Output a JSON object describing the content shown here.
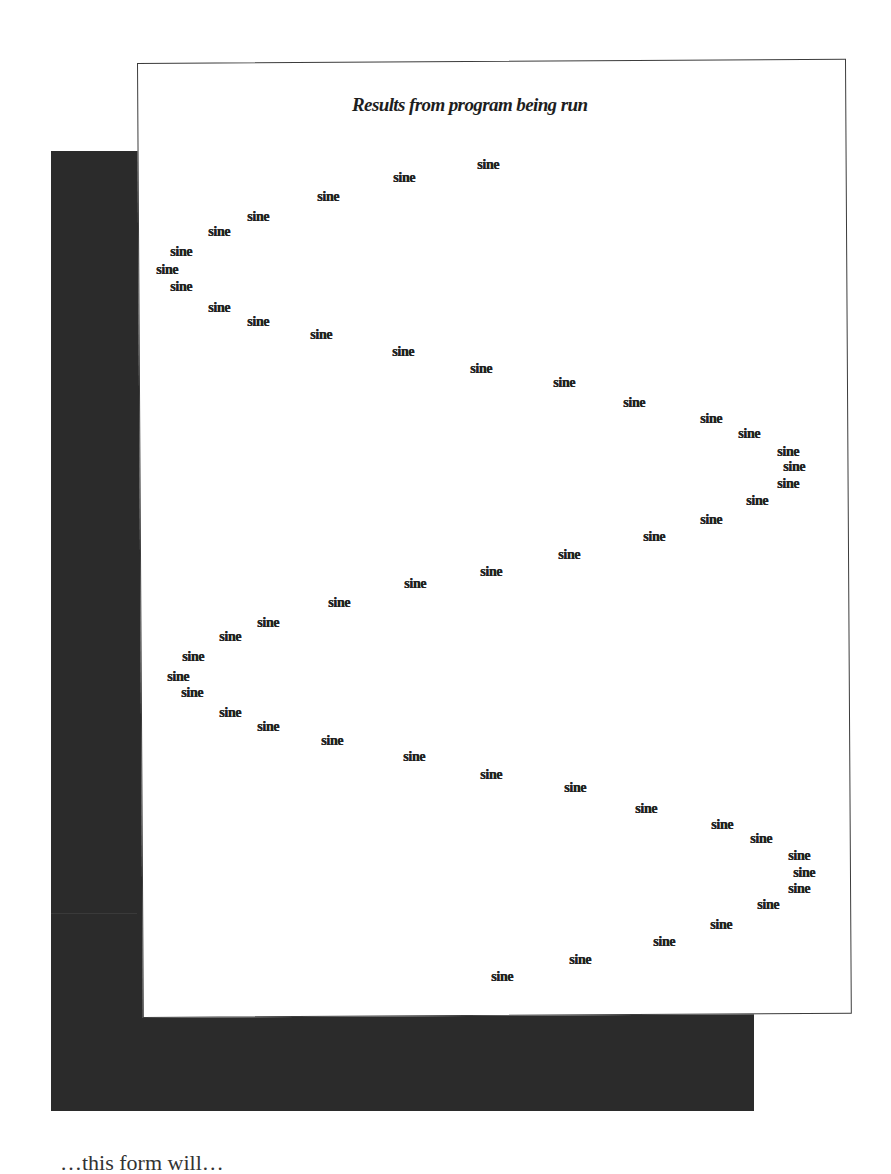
{
  "figure": {
    "title": "Results from program being run",
    "point_label": "sine",
    "footer_partial_text": "…this form will…"
  },
  "colors": {
    "page_background": "#ffffff",
    "shadow": "#2b2b2b",
    "panel_background": "#ffffff",
    "panel_border": "#3c3c3c",
    "text": "#222222"
  },
  "chart_data": {
    "type": "scatter",
    "title": "Results from program being run",
    "xlabel": "",
    "ylabel": "",
    "marker_text": "sine",
    "grid": false,
    "legend": null,
    "xlim": [
      -1,
      1
    ],
    "series": [
      {
        "name": "sine",
        "step": [
          0,
          1,
          2,
          3,
          4,
          5,
          6,
          7,
          8,
          9,
          10,
          11,
          12,
          13,
          14,
          15,
          16,
          17,
          18,
          19,
          20,
          21,
          22,
          23,
          24,
          25,
          26,
          27,
          28,
          29,
          30,
          31,
          32,
          33,
          34,
          35,
          36,
          37,
          38,
          39,
          40,
          41,
          42,
          43,
          44,
          45,
          46,
          47,
          48
        ],
        "values": [
          0.0,
          -0.26,
          -0.5,
          -0.71,
          -0.87,
          -0.97,
          -1.0,
          -0.97,
          -0.87,
          -0.71,
          -0.5,
          -0.26,
          0.0,
          0.26,
          0.5,
          0.71,
          0.87,
          0.97,
          1.0,
          0.97,
          0.87,
          0.71,
          0.5,
          0.26,
          0.0,
          -0.26,
          -0.5,
          -0.71,
          -0.87,
          -0.97,
          -1.0,
          -0.97,
          -0.87,
          -0.71,
          -0.5,
          -0.26,
          0.0,
          0.26,
          0.5,
          0.71,
          0.87,
          0.97,
          1.0,
          0.97,
          0.87,
          0.71,
          0.5,
          0.26,
          0.0
        ]
      }
    ],
    "points_px": [
      {
        "x": 477,
        "y": 158
      },
      {
        "x": 393,
        "y": 171
      },
      {
        "x": 317,
        "y": 190
      },
      {
        "x": 247,
        "y": 210
      },
      {
        "x": 208,
        "y": 225
      },
      {
        "x": 170,
        "y": 245
      },
      {
        "x": 156,
        "y": 263
      },
      {
        "x": 170,
        "y": 280
      },
      {
        "x": 208,
        "y": 301
      },
      {
        "x": 247,
        "y": 315
      },
      {
        "x": 310,
        "y": 328
      },
      {
        "x": 392,
        "y": 345
      },
      {
        "x": 470,
        "y": 362
      },
      {
        "x": 553,
        "y": 376
      },
      {
        "x": 623,
        "y": 396
      },
      {
        "x": 700,
        "y": 412
      },
      {
        "x": 738,
        "y": 427
      },
      {
        "x": 777,
        "y": 445
      },
      {
        "x": 783,
        "y": 460
      },
      {
        "x": 777,
        "y": 477
      },
      {
        "x": 746,
        "y": 494
      },
      {
        "x": 700,
        "y": 513
      },
      {
        "x": 643,
        "y": 530
      },
      {
        "x": 558,
        "y": 548
      },
      {
        "x": 480,
        "y": 565
      },
      {
        "x": 404,
        "y": 577
      },
      {
        "x": 328,
        "y": 596
      },
      {
        "x": 257,
        "y": 616
      },
      {
        "x": 219,
        "y": 630
      },
      {
        "x": 182,
        "y": 650
      },
      {
        "x": 167,
        "y": 670
      },
      {
        "x": 181,
        "y": 686
      },
      {
        "x": 219,
        "y": 706
      },
      {
        "x": 257,
        "y": 720
      },
      {
        "x": 321,
        "y": 734
      },
      {
        "x": 403,
        "y": 750
      },
      {
        "x": 480,
        "y": 768
      },
      {
        "x": 564,
        "y": 781
      },
      {
        "x": 635,
        "y": 802
      },
      {
        "x": 711,
        "y": 818
      },
      {
        "x": 750,
        "y": 832
      },
      {
        "x": 788,
        "y": 849
      },
      {
        "x": 793,
        "y": 866
      },
      {
        "x": 788,
        "y": 882
      },
      {
        "x": 757,
        "y": 898
      },
      {
        "x": 710,
        "y": 918
      },
      {
        "x": 653,
        "y": 935
      },
      {
        "x": 569,
        "y": 953
      },
      {
        "x": 491,
        "y": 970
      }
    ]
  }
}
